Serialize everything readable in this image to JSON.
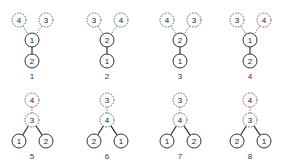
{
  "figure": {
    "node_radius": 7,
    "colors": {
      "stroke": "#333333",
      "dashed_stroke": "#555555",
      "background": "#ffffff"
    },
    "diagrams": [
      {
        "caption": "1",
        "nodes": [
          {
            "label": "4",
            "x": 19,
            "y": 20,
            "style": "dashed"
          },
          {
            "label": "3",
            "x": 46,
            "y": 20,
            "style": "dashed"
          },
          {
            "label": "1",
            "x": 32,
            "y": 40,
            "style": "solid"
          },
          {
            "label": "2",
            "x": 32,
            "y": 61,
            "style": "solid"
          }
        ],
        "edges": [
          [
            0,
            2,
            "dashed"
          ],
          [
            1,
            2,
            "dashed"
          ],
          [
            2,
            3,
            "solid"
          ]
        ],
        "caption_pos": [
          32,
          79
        ]
      },
      {
        "caption": "2",
        "nodes": [
          {
            "label": "3",
            "x": 94,
            "y": 20,
            "style": "dashed"
          },
          {
            "label": "4",
            "x": 121,
            "y": 20,
            "style": "dashed"
          },
          {
            "label": "2",
            "x": 107,
            "y": 40,
            "style": "solid"
          },
          {
            "label": "1",
            "x": 107,
            "y": 61,
            "style": "solid"
          }
        ],
        "edges": [
          [
            0,
            2,
            "dashed"
          ],
          [
            1,
            2,
            "dashed"
          ],
          [
            2,
            3,
            "solid"
          ]
        ],
        "caption_pos": [
          107,
          79
        ]
      },
      {
        "caption": "3",
        "nodes": [
          {
            "label": "4",
            "x": 167,
            "y": 20,
            "style": "dashed"
          },
          {
            "label": "3",
            "x": 194,
            "y": 20,
            "style": "dashed"
          },
          {
            "label": "2",
            "x": 180,
            "y": 40,
            "style": "solid"
          },
          {
            "label": "1",
            "x": 180,
            "y": 61,
            "style": "solid"
          }
        ],
        "edges": [
          [
            0,
            2,
            "dashed"
          ],
          [
            1,
            2,
            "dashed"
          ],
          [
            2,
            3,
            "solid"
          ]
        ],
        "caption_pos": [
          180,
          79
        ]
      },
      {
        "caption": "4",
        "nodes": [
          {
            "label": "3",
            "x": 237,
            "y": 20,
            "style": "dashed"
          },
          {
            "label": "4",
            "x": 264,
            "y": 20,
            "style": "dashed"
          },
          {
            "label": "1",
            "x": 250,
            "y": 40,
            "style": "solid"
          },
          {
            "label": "2",
            "x": 250,
            "y": 61,
            "style": "solid"
          }
        ],
        "edges": [
          [
            0,
            2,
            "dashed"
          ],
          [
            1,
            2,
            "dashed"
          ],
          [
            2,
            3,
            "solid"
          ]
        ],
        "caption_pos": [
          250,
          79
        ]
      },
      {
        "caption": "5",
        "nodes": [
          {
            "label": "4",
            "x": 32,
            "y": 100,
            "style": "dashed"
          },
          {
            "label": "3",
            "x": 32,
            "y": 120,
            "style": "dashed"
          },
          {
            "label": "1",
            "x": 19,
            "y": 141,
            "style": "solid"
          },
          {
            "label": "2",
            "x": 46,
            "y": 141,
            "style": "solid"
          }
        ],
        "edges": [
          [
            0,
            1,
            "dashed"
          ],
          [
            1,
            2,
            "solid"
          ],
          [
            1,
            3,
            "solid"
          ]
        ],
        "caption_pos": [
          32,
          159
        ]
      },
      {
        "caption": "6",
        "nodes": [
          {
            "label": "3",
            "x": 107,
            "y": 100,
            "style": "dashed"
          },
          {
            "label": "4",
            "x": 107,
            "y": 120,
            "style": "dashed"
          },
          {
            "label": "2",
            "x": 94,
            "y": 141,
            "style": "solid"
          },
          {
            "label": "1",
            "x": 121,
            "y": 141,
            "style": "solid"
          }
        ],
        "edges": [
          [
            0,
            1,
            "dashed"
          ],
          [
            1,
            2,
            "solid"
          ],
          [
            1,
            3,
            "solid"
          ]
        ],
        "caption_pos": [
          107,
          159
        ]
      },
      {
        "caption": "7",
        "nodes": [
          {
            "label": "3",
            "x": 180,
            "y": 100,
            "style": "dashed"
          },
          {
            "label": "4",
            "x": 180,
            "y": 120,
            "style": "dashed"
          },
          {
            "label": "1",
            "x": 167,
            "y": 141,
            "style": "solid"
          },
          {
            "label": "2",
            "x": 194,
            "y": 141,
            "style": "solid"
          }
        ],
        "edges": [
          [
            0,
            1,
            "dashed"
          ],
          [
            1,
            2,
            "solid"
          ],
          [
            1,
            3,
            "solid"
          ]
        ],
        "caption_pos": [
          180,
          159
        ]
      },
      {
        "caption": "8",
        "nodes": [
          {
            "label": "4",
            "x": 250,
            "y": 100,
            "style": "dashed"
          },
          {
            "label": "3",
            "x": 250,
            "y": 120,
            "style": "dashed"
          },
          {
            "label": "2",
            "x": 237,
            "y": 141,
            "style": "solid"
          },
          {
            "label": "1",
            "x": 264,
            "y": 141,
            "style": "solid"
          }
        ],
        "edges": [
          [
            0,
            1,
            "dashed"
          ],
          [
            1,
            2,
            "solid"
          ],
          [
            1,
            3,
            "solid"
          ]
        ],
        "caption_pos": [
          250,
          159
        ]
      }
    ]
  }
}
